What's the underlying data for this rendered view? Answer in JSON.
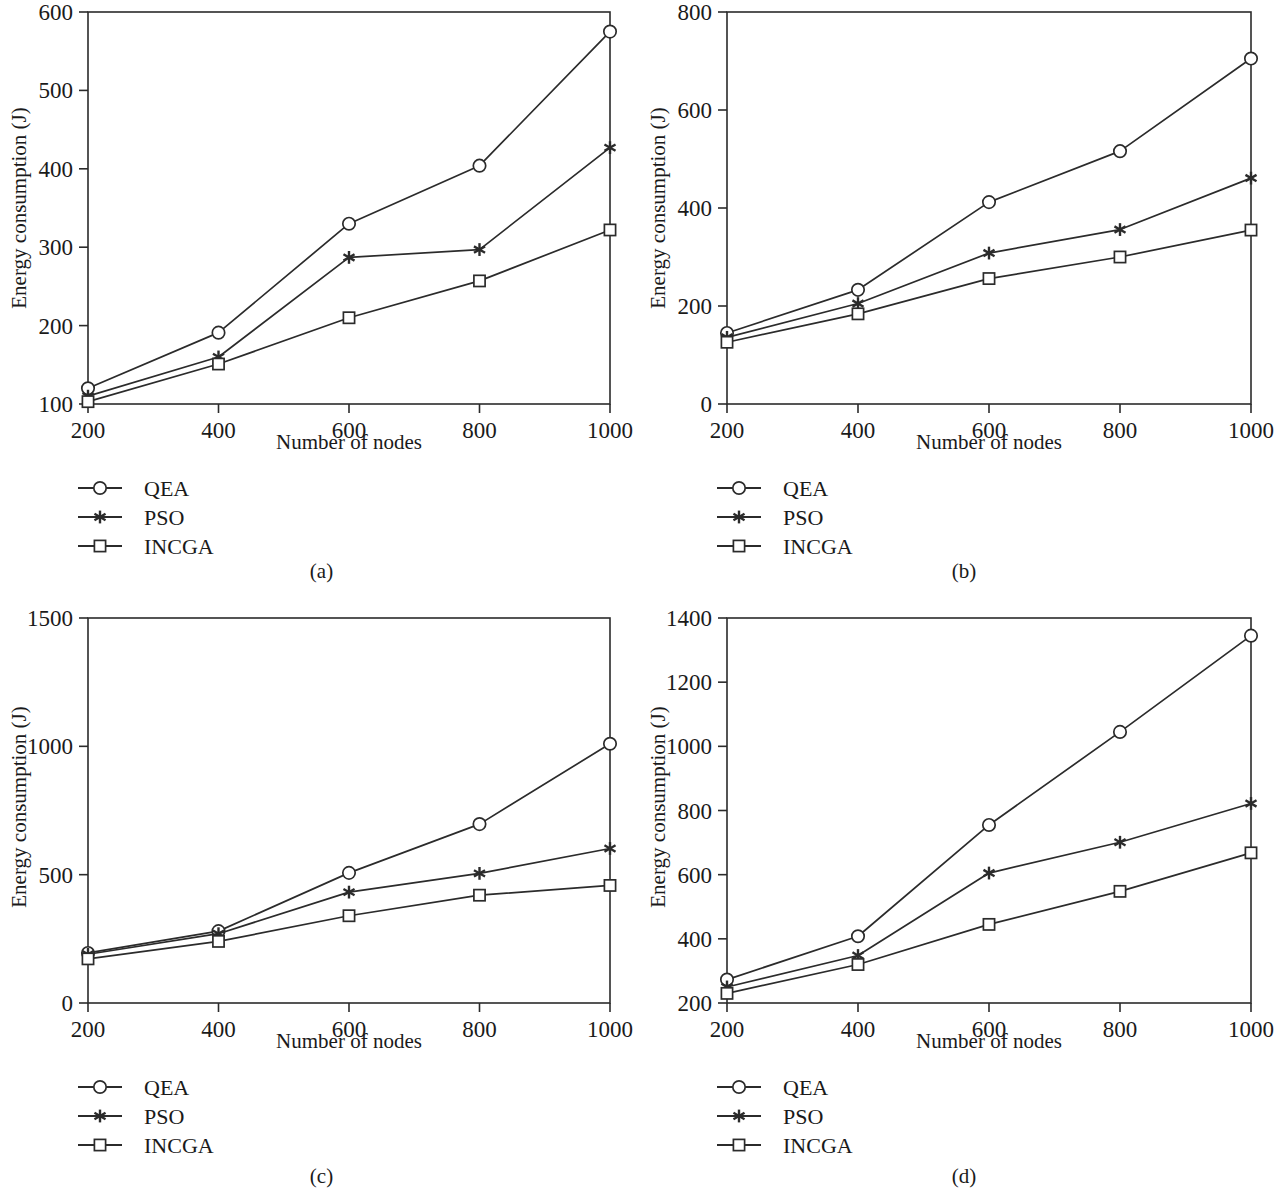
{
  "figure": {
    "panel_count": 4,
    "series_names": [
      "QEA",
      "PSO",
      "INCGA"
    ],
    "markers": {
      "QEA": "circle-marker",
      "PSO": "asterisk-marker",
      "INCGA": "square-marker"
    },
    "line_color": "#2b2b2b",
    "background": "#ffffff",
    "captions": {
      "a": "(a)",
      "b": "(b)",
      "c": "(c)",
      "d": "(d)"
    },
    "legend": {
      "items": [
        {
          "label": "QEA",
          "marker": "circle-marker"
        },
        {
          "label": "PSO",
          "marker": "asterisk-marker"
        },
        {
          "label": "INCGA",
          "marker": "square-marker"
        }
      ]
    }
  },
  "chart_data": [
    {
      "id": "a",
      "type": "line",
      "title": "",
      "xlabel": "Number of nodes",
      "ylabel": "Energy consumption (J)",
      "x": [
        200,
        400,
        600,
        800,
        1000
      ],
      "xticklabels": [
        "200",
        "400",
        "600",
        "800",
        "1000"
      ],
      "xlim": [
        200,
        1000
      ],
      "ylim": [
        100,
        600
      ],
      "yticks": [
        100,
        200,
        300,
        400,
        500,
        600
      ],
      "yticklabels": [
        "100",
        "200",
        "300",
        "400",
        "500",
        "600"
      ],
      "grid": false,
      "legend_position": "below-left",
      "series": [
        {
          "name": "QEA",
          "marker": "circle-marker",
          "values": [
            120,
            191,
            330,
            404,
            575
          ]
        },
        {
          "name": "PSO",
          "marker": "asterisk-marker",
          "values": [
            110,
            160,
            287,
            297,
            427
          ]
        },
        {
          "name": "INCGA",
          "marker": "square-marker",
          "values": [
            103,
            151,
            210,
            257,
            322
          ]
        }
      ]
    },
    {
      "id": "b",
      "type": "line",
      "title": "",
      "xlabel": "Number of nodes",
      "ylabel": "Energy consumption (J)",
      "x": [
        200,
        400,
        600,
        800,
        1000
      ],
      "xticklabels": [
        "200",
        "400",
        "600",
        "800",
        "1000"
      ],
      "xlim": [
        200,
        1000
      ],
      "ylim": [
        0,
        800
      ],
      "yticks": [
        0,
        200,
        400,
        600,
        800
      ],
      "yticklabels": [
        "0",
        "200",
        "400",
        "600",
        "800"
      ],
      "grid": false,
      "legend_position": "below-left",
      "series": [
        {
          "name": "QEA",
          "marker": "circle-marker",
          "values": [
            145,
            233,
            412,
            516,
            705
          ]
        },
        {
          "name": "PSO",
          "marker": "asterisk-marker",
          "values": [
            136,
            205,
            308,
            356,
            461
          ]
        },
        {
          "name": "INCGA",
          "marker": "square-marker",
          "values": [
            126,
            184,
            256,
            300,
            355
          ]
        }
      ]
    },
    {
      "id": "c",
      "type": "line",
      "title": "",
      "xlabel": "Number of nodes",
      "ylabel": "Energy consumption (J)",
      "x": [
        200,
        400,
        600,
        800,
        1000
      ],
      "xticklabels": [
        "200",
        "400",
        "600",
        "800",
        "1000"
      ],
      "xlim": [
        200,
        1000
      ],
      "ylim": [
        0,
        1500
      ],
      "yticks": [
        0,
        500,
        1000,
        1500
      ],
      "yticklabels": [
        "0",
        "500",
        "1000",
        "1500"
      ],
      "grid": false,
      "legend_position": "below-left",
      "series": [
        {
          "name": "QEA",
          "marker": "circle-marker",
          "values": [
            195,
            280,
            507,
            697,
            1010
          ]
        },
        {
          "name": "PSO",
          "marker": "asterisk-marker",
          "values": [
            190,
            270,
            432,
            505,
            602
          ]
        },
        {
          "name": "INCGA",
          "marker": "square-marker",
          "values": [
            172,
            240,
            340,
            420,
            458
          ]
        }
      ]
    },
    {
      "id": "d",
      "type": "line",
      "title": "",
      "xlabel": "Number of nodes",
      "ylabel": "Energy consumption (J)",
      "x": [
        200,
        400,
        600,
        800,
        1000
      ],
      "xticklabels": [
        "200",
        "400",
        "600",
        "800",
        "1000"
      ],
      "xlim": [
        200,
        1000
      ],
      "ylim": [
        200,
        1400
      ],
      "yticks": [
        200,
        400,
        600,
        800,
        1000,
        1200,
        1400
      ],
      "yticklabels": [
        "200",
        "400",
        "600",
        "800",
        "1000",
        "1200",
        "1400"
      ],
      "grid": false,
      "legend_position": "below-left",
      "series": [
        {
          "name": "QEA",
          "marker": "circle-marker",
          "values": [
            273,
            408,
            755,
            1045,
            1345
          ]
        },
        {
          "name": "PSO",
          "marker": "asterisk-marker",
          "values": [
            250,
            348,
            605,
            701,
            822
          ]
        },
        {
          "name": "INCGA",
          "marker": "square-marker",
          "values": [
            230,
            320,
            445,
            548,
            668
          ]
        }
      ]
    }
  ]
}
